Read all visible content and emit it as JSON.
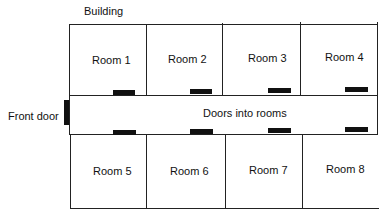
{
  "diagram": {
    "title": "Building",
    "front_door_label": "Front door",
    "corridor_label": "Doors into rooms",
    "rooms_top": [
      {
        "label": "Room 1"
      },
      {
        "label": "Room 2"
      },
      {
        "label": "Room 3"
      },
      {
        "label": "Room 4"
      }
    ],
    "rooms_bottom": [
      {
        "label": "Room 5"
      },
      {
        "label": "Room 6"
      },
      {
        "label": "Room 7"
      },
      {
        "label": "Room 8"
      }
    ],
    "colors": {
      "line": "#222222",
      "door": "#111111",
      "background": "#ffffff"
    }
  }
}
